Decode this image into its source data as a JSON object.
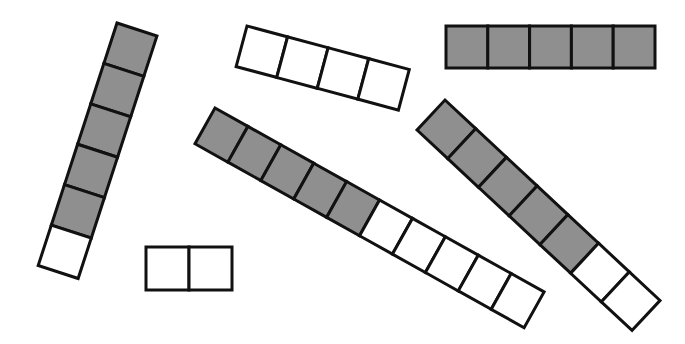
{
  "colors": {
    "shaded": "#8f8f8f",
    "unshaded": "#ffffff",
    "outline": "#111111",
    "background": "#ffffff"
  },
  "strips": [
    {
      "id": "strip-a",
      "total_cells": 6,
      "shaded_cells": 5,
      "orientation": "tilted-steep",
      "x": 117,
      "y": 23,
      "angle": 18,
      "cell_w": 42,
      "cell_h": 42.5,
      "direction": "vertical"
    },
    {
      "id": "strip-b",
      "total_cells": 4,
      "shaded_cells": 0,
      "orientation": "tilted-shallow",
      "x": 247,
      "y": 26,
      "angle": 15,
      "cell_w": 42,
      "cell_h": 42,
      "direction": "horizontal"
    },
    {
      "id": "strip-c",
      "total_cells": 5,
      "shaded_cells": 5,
      "orientation": "horizontal",
      "x": 446,
      "y": 26,
      "angle": 0,
      "cell_w": 41.8,
      "cell_h": 42,
      "direction": "horizontal"
    },
    {
      "id": "strip-d",
      "total_cells": 10,
      "shaded_cells": 5,
      "orientation": "tilted-long",
      "x": 215,
      "y": 108,
      "angle": 29.2,
      "cell_w": 37.7,
      "cell_h": 41,
      "direction": "horizontal"
    },
    {
      "id": "strip-e",
      "total_cells": 7,
      "shaded_cells": 5,
      "orientation": "tilted-diagonal",
      "x": 445,
      "y": 100,
      "angle": 43,
      "cell_w": 42,
      "cell_h": 41,
      "direction": "horizontal"
    },
    {
      "id": "strip-f",
      "total_cells": 2,
      "shaded_cells": 0,
      "orientation": "horizontal",
      "x": 146,
      "y": 247,
      "angle": 0,
      "cell_w": 43,
      "cell_h": 43,
      "direction": "horizontal"
    }
  ]
}
